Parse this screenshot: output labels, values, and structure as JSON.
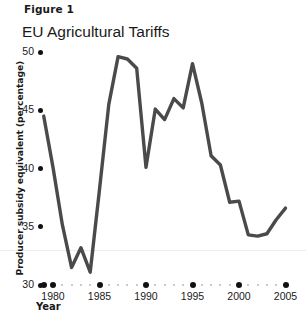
{
  "figure": {
    "label": "Figure 1",
    "title": "EU Agricultural Tariffs"
  },
  "axis_titles": {
    "y": "Producer subsidy equivalent (percentage)",
    "x": "Year"
  },
  "colors": {
    "line": "#4a4a4a",
    "tick_dot": "#111111",
    "minor_dot": "#b9b9b9",
    "rule": "#ececec",
    "text": "#1a1a1a",
    "background": "#ffffff"
  },
  "y_ticks": [
    {
      "label": "50",
      "value": 50
    },
    {
      "label": "45",
      "value": 45
    },
    {
      "label": "40",
      "value": 40
    },
    {
      "label": "35",
      "value": 35
    },
    {
      "label": "30",
      "value": 30
    }
  ],
  "x_ticks": [
    {
      "label": "1980",
      "value": 1980
    },
    {
      "label": "1985",
      "value": 1985
    },
    {
      "label": "1990",
      "value": 1990
    },
    {
      "label": "1995",
      "value": 1995
    },
    {
      "label": "2000",
      "value": 2000
    },
    {
      "label": "2005",
      "value": 2005
    }
  ],
  "chart_data": {
    "type": "line",
    "title": "EU Agricultural Tariffs",
    "subtitle": "Figure 1",
    "xlabel": "Year",
    "ylabel": "Producer subsidy equivalent (percentage)",
    "xlim": [
      1979,
      2005.5
    ],
    "ylim": [
      30,
      50
    ],
    "grid": false,
    "legend": "none",
    "series": [
      {
        "name": "Producer subsidy equivalent",
        "x": [
          1979,
          1980,
          1981,
          1982,
          1983,
          1984,
          1985,
          1986,
          1987,
          1988,
          1989,
          1990,
          1991,
          1992,
          1993,
          1994,
          1995,
          1996,
          1997,
          1998,
          1999,
          2000,
          2001,
          2002,
          2003,
          2004,
          2005
        ],
        "values": [
          44.5,
          40.1,
          35.2,
          31.5,
          33.2,
          31.1,
          38.2,
          45.5,
          49.6,
          49.4,
          48.6,
          40.1,
          45.1,
          44.2,
          46.0,
          45.2,
          49.0,
          45.6,
          41.1,
          40.3,
          37.1,
          37.2,
          34.3,
          34.2,
          34.4,
          35.6,
          36.6
        ]
      }
    ]
  }
}
